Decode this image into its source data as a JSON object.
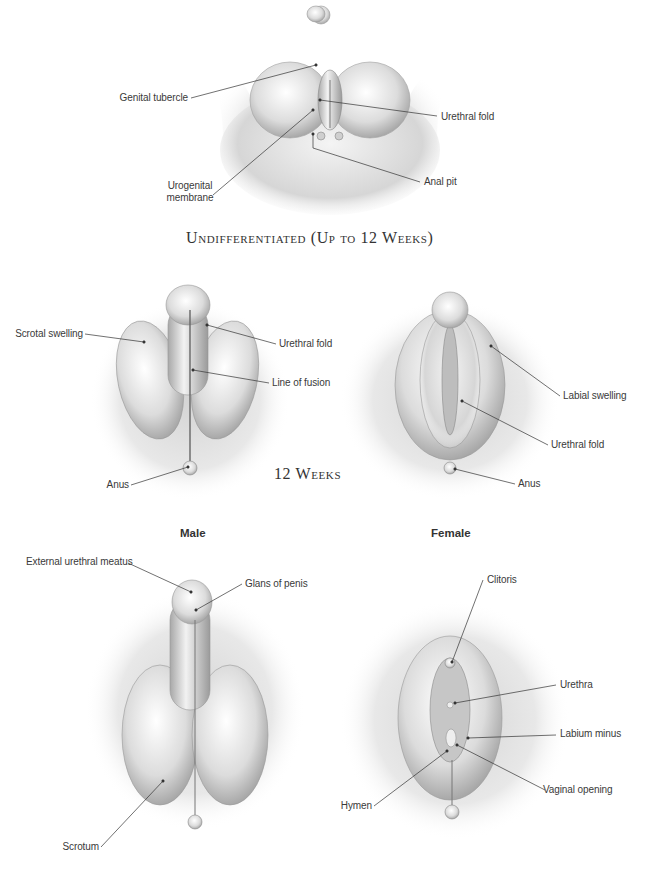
{
  "sections": {
    "undifferentiated": {
      "title": "Undifferentiated (Up to 12 Weeks)",
      "labels": {
        "genital_tubercle": "Genital tubercle",
        "urethral_fold": "Urethral fold",
        "urogenital_membrane_1": "Urogenital",
        "urogenital_membrane_2": "membrane",
        "anal_pit": "Anal pit"
      }
    },
    "twelve_weeks": {
      "title": "12 Weeks",
      "male_labels": {
        "scrotal_swelling": "Scrotal swelling",
        "urethral_fold": "Urethral fold",
        "line_of_fusion": "Line of fusion",
        "anus": "Anus"
      },
      "female_labels": {
        "labial_swelling": "Labial swelling",
        "urethral_fold": "Urethral fold",
        "anus": "Anus"
      }
    },
    "fully_developed": {
      "title": "Fully Developed",
      "male_heading": "Male",
      "female_heading": "Female",
      "male_labels": {
        "external_urethral_meatus": "External urethral meatus",
        "glans_of_penis": "Glans of penis",
        "scrotum": "Scrotum"
      },
      "female_labels": {
        "clitoris": "Clitoris",
        "urethra": "Urethra",
        "labium_minus": "Labium minus",
        "vaginal_opening": "Vaginal opening",
        "hymen": "Hymen"
      }
    }
  },
  "colors": {
    "background": "#ffffff",
    "line": "#333333",
    "text": "#3a3a3a",
    "shade_dark": "#9a9a9a",
    "shade_mid": "#c8c8c8",
    "shade_light": "#eeeeee"
  }
}
